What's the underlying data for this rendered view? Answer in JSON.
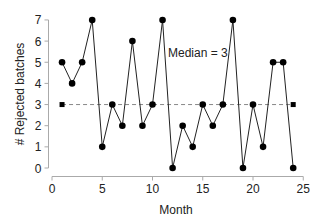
{
  "chart_data": {
    "type": "line",
    "title": "",
    "xlabel": "Month",
    "ylabel": "# Rejected batches",
    "xlim": [
      0,
      25
    ],
    "ylim": [
      0,
      7
    ],
    "x_ticks": [
      0,
      5,
      10,
      15,
      20,
      25
    ],
    "y_ticks": [
      0,
      1,
      2,
      3,
      4,
      5,
      6,
      7
    ],
    "grid": false,
    "legend": null,
    "x": [
      1,
      2,
      3,
      4,
      5,
      6,
      7,
      8,
      9,
      10,
      11,
      12,
      13,
      14,
      15,
      16,
      17,
      18,
      19,
      20,
      21,
      22,
      23,
      24
    ],
    "series": [
      {
        "name": "Rejected batches",
        "values": [
          5,
          4,
          5,
          7,
          1,
          3,
          2,
          6,
          2,
          3,
          7,
          0,
          2,
          1,
          3,
          2,
          3,
          7,
          0,
          3,
          1,
          5,
          5,
          0
        ],
        "marker": "circle",
        "color": "#000000"
      }
    ],
    "reference_lines": [
      {
        "name": "Median",
        "value": 3,
        "x_start": 1,
        "x_end": 24,
        "style": "dashed",
        "color": "#888888",
        "end_markers": "square"
      }
    ],
    "annotations": [
      {
        "text": "Median = 3",
        "x": 12,
        "y": 5.3
      }
    ]
  }
}
